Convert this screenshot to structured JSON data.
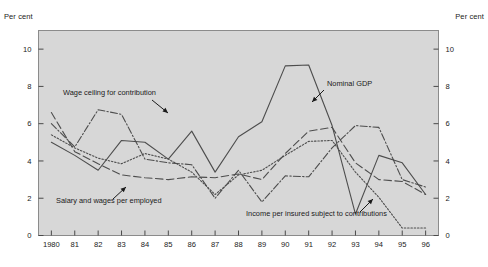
{
  "chart": {
    "title": "",
    "unit_left": "Per cent",
    "unit_right": "Per cent",
    "plot_bg_color": "#d7d7d7",
    "line_color": "#4d4d4d"
  },
  "axis": {
    "y_ticks": [
      "0",
      "2",
      "4",
      "6",
      "8",
      "10"
    ],
    "y_ticks_right": [
      "0",
      "2",
      "4",
      "6",
      "8",
      "10"
    ],
    "x_ticks": [
      "1980",
      "81",
      "82",
      "83",
      "84",
      "85",
      "86",
      "87",
      "88",
      "89",
      "90",
      "91",
      "92",
      "93",
      "94",
      "95",
      "96"
    ]
  },
  "annotations": [
    {
      "id": "wage-ceiling",
      "label": "Wage ceiling for contribution"
    },
    {
      "id": "nominal-gdp",
      "label": "Nominal GDP"
    },
    {
      "id": "salary-wages",
      "label": "Salary and wages per employed"
    },
    {
      "id": "income-insured",
      "label": "Income per insured subject to contributions"
    }
  ],
  "chart_data": {
    "type": "line",
    "title": "",
    "xlabel": "",
    "ylabel": "Per cent",
    "ylim": [
      0,
      11
    ],
    "grid": false,
    "legend": "annotations-inline",
    "x": [
      "1980",
      "81",
      "82",
      "83",
      "84",
      "85",
      "86",
      "87",
      "88",
      "89",
      "90",
      "91",
      "92",
      "93",
      "94",
      "95",
      "96"
    ],
    "series": [
      {
        "name": "Nominal GDP",
        "style": "solid",
        "values": [
          5.0,
          4.3,
          3.5,
          5.1,
          5.0,
          4.1,
          5.6,
          3.4,
          5.3,
          6.1,
          9.1,
          9.15,
          5.9,
          1.15,
          4.3,
          3.9,
          2.2
        ]
      },
      {
        "name": "Wage ceiling for contribution",
        "style": "dash-dot",
        "values": [
          6.0,
          4.75,
          6.75,
          6.5,
          4.1,
          3.9,
          3.8,
          2.0,
          3.5,
          1.8,
          3.2,
          3.15,
          4.7,
          5.9,
          5.8,
          3.0,
          2.6
        ]
      },
      {
        "name": "Salary and wages per employed",
        "style": "long-dash",
        "values": [
          6.6,
          4.5,
          3.85,
          3.25,
          3.1,
          3.0,
          3.15,
          3.1,
          3.3,
          3.0,
          4.4,
          5.6,
          5.8,
          3.9,
          3.0,
          2.9,
          2.2
        ]
      },
      {
        "name": "Income per insured subject to contributions",
        "style": "dotted",
        "values": [
          5.4,
          4.7,
          4.15,
          3.85,
          4.4,
          4.1,
          3.4,
          2.2,
          3.25,
          3.5,
          4.3,
          5.05,
          5.1,
          3.4,
          2.05,
          0.4,
          0.4
        ]
      }
    ]
  }
}
